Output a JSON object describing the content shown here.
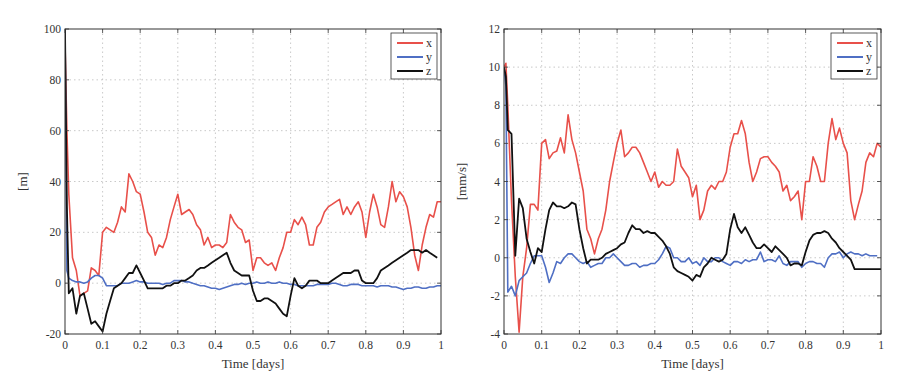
{
  "chart_data": [
    {
      "type": "line",
      "title": "",
      "xlabel": "Time [days]",
      "ylabel": "[m]",
      "xlim": [
        0,
        1
      ],
      "ylim": [
        -20,
        100
      ],
      "xticks": [
        "0",
        "0.1",
        "0.2",
        "0.3",
        "0.4",
        "0.5",
        "0.6",
        "0.7",
        "0.8",
        "0.9",
        "1"
      ],
      "yticks": [
        "-20",
        "0",
        "20",
        "40",
        "60",
        "80",
        "100"
      ],
      "grid": true,
      "legend_position": "top-right",
      "legend": [
        "x",
        "y",
        "z"
      ],
      "x": [
        0,
        0.005,
        0.01,
        0.02,
        0.03,
        0.04,
        0.05,
        0.06,
        0.07,
        0.08,
        0.09,
        0.1,
        0.11,
        0.12,
        0.13,
        0.14,
        0.15,
        0.16,
        0.17,
        0.18,
        0.19,
        0.2,
        0.21,
        0.22,
        0.23,
        0.24,
        0.25,
        0.26,
        0.27,
        0.28,
        0.29,
        0.3,
        0.31,
        0.32,
        0.33,
        0.34,
        0.35,
        0.36,
        0.37,
        0.38,
        0.39,
        0.4,
        0.41,
        0.42,
        0.43,
        0.44,
        0.45,
        0.46,
        0.47,
        0.48,
        0.49,
        0.5,
        0.51,
        0.52,
        0.53,
        0.54,
        0.55,
        0.56,
        0.57,
        0.58,
        0.59,
        0.6,
        0.61,
        0.62,
        0.63,
        0.64,
        0.65,
        0.66,
        0.67,
        0.68,
        0.69,
        0.7,
        0.71,
        0.72,
        0.73,
        0.74,
        0.75,
        0.76,
        0.77,
        0.78,
        0.79,
        0.8,
        0.81,
        0.82,
        0.83,
        0.84,
        0.85,
        0.86,
        0.87,
        0.88,
        0.89,
        0.9,
        0.91,
        0.92,
        0.93,
        0.94,
        0.95,
        0.96,
        0.97,
        0.98,
        0.99,
        1.0
      ],
      "series": [
        {
          "name": "x",
          "color": "#e8504a",
          "values": [
            95,
            60,
            35,
            10,
            5,
            -5,
            -4,
            -3,
            6,
            5,
            3,
            20,
            22,
            21,
            20,
            24,
            30,
            28,
            43,
            40,
            36,
            35,
            28,
            20,
            18,
            11,
            15,
            14,
            18,
            25,
            30,
            35,
            27,
            28,
            29,
            27,
            23,
            21,
            15,
            18,
            14,
            15,
            15,
            14,
            16,
            27,
            24,
            22,
            21,
            16,
            17,
            5,
            10,
            10,
            8,
            7,
            8,
            5,
            10,
            14,
            20,
            20,
            25,
            23,
            26,
            23,
            15,
            15,
            22,
            24,
            28,
            30,
            31,
            32,
            33,
            27,
            30,
            27,
            30,
            32,
            28,
            18,
            28,
            35,
            30,
            23,
            22,
            30,
            40,
            32,
            36,
            34,
            30,
            22,
            11,
            5,
            15,
            22,
            27,
            26,
            32,
            32
          ]
        },
        {
          "name": "y",
          "color": "#4f6fc4",
          "values": [
            100,
            5,
            2,
            1,
            0.5,
            0.5,
            0,
            0.5,
            2,
            3,
            3,
            2,
            -1,
            -1,
            -1,
            -1,
            0,
            0,
            0,
            0.5,
            1,
            0.5,
            0.5,
            0,
            0,
            0,
            0,
            -0.5,
            0,
            0,
            1,
            1,
            1,
            0.5,
            0.5,
            0,
            -0.5,
            -1,
            -1,
            -1.5,
            -2,
            -2,
            -2.5,
            -2,
            -1.5,
            -1,
            -0.5,
            -0.5,
            0,
            -0.5,
            0,
            0,
            0.5,
            0,
            0,
            0.5,
            0,
            0,
            0.5,
            0,
            0,
            -0.5,
            -0.5,
            -1,
            -1,
            -1,
            -1,
            -1,
            -0.5,
            -0.5,
            -0.5,
            -0.5,
            0,
            0,
            -0.5,
            -1,
            -1,
            -0.5,
            -0.5,
            -0.5,
            -1,
            -1,
            -1,
            -1,
            -1.5,
            -1,
            -1,
            -1,
            -1.5,
            -1.5,
            -2,
            -2.5,
            -2,
            -2,
            -1.5,
            -1.5,
            -2,
            -2,
            -1.5,
            -1.5,
            -1,
            -1
          ]
        },
        {
          "name": "z",
          "color": "#111111",
          "values": [
            100,
            30,
            -4,
            -2,
            -12,
            -5,
            -4,
            -10,
            -16,
            -15,
            -17,
            -19,
            -12,
            -7,
            -2,
            -1,
            0,
            2,
            4,
            4,
            7,
            4,
            1,
            -2,
            -2,
            -2,
            -2,
            -2,
            -1,
            -1,
            0,
            0,
            1,
            1,
            2,
            3,
            5,
            6,
            6,
            7,
            8,
            9,
            10,
            11,
            12,
            8,
            5,
            4,
            3,
            3,
            3,
            -3,
            -7,
            -7,
            -6,
            -6,
            -7,
            -8,
            -10,
            -12,
            -13,
            -5,
            2,
            -1,
            -2,
            -1,
            1,
            1,
            1,
            0,
            0,
            0,
            1,
            2,
            3,
            4,
            4,
            4,
            5,
            5,
            1,
            0,
            0,
            0,
            2,
            5,
            6,
            7,
            8,
            9,
            10,
            11,
            12,
            13,
            13,
            13,
            12,
            13,
            12,
            11,
            10
          ]
        }
      ]
    },
    {
      "type": "line",
      "title": "",
      "xlabel": "Time [days]",
      "ylabel": "[mm/s]",
      "xlim": [
        0,
        1
      ],
      "ylim": [
        -4,
        12
      ],
      "xticks": [
        "0",
        "0.1",
        "0.2",
        "0.3",
        "0.4",
        "0.5",
        "0.6",
        "0.7",
        "0.8",
        "0.9",
        "1"
      ],
      "yticks": [
        "-4",
        "-2",
        "0",
        "2",
        "4",
        "6",
        "8",
        "10",
        "12"
      ],
      "grid": true,
      "legend_position": "top-right",
      "legend": [
        "x",
        "y",
        "z"
      ],
      "x": [
        0,
        0.005,
        0.01,
        0.02,
        0.03,
        0.04,
        0.05,
        0.06,
        0.07,
        0.08,
        0.09,
        0.1,
        0.11,
        0.12,
        0.13,
        0.14,
        0.15,
        0.16,
        0.17,
        0.18,
        0.19,
        0.2,
        0.21,
        0.22,
        0.23,
        0.24,
        0.25,
        0.26,
        0.27,
        0.28,
        0.29,
        0.3,
        0.31,
        0.32,
        0.33,
        0.34,
        0.35,
        0.36,
        0.37,
        0.38,
        0.39,
        0.4,
        0.41,
        0.42,
        0.43,
        0.44,
        0.45,
        0.46,
        0.47,
        0.48,
        0.49,
        0.5,
        0.51,
        0.52,
        0.53,
        0.54,
        0.55,
        0.56,
        0.57,
        0.58,
        0.59,
        0.6,
        0.61,
        0.62,
        0.63,
        0.64,
        0.65,
        0.66,
        0.67,
        0.68,
        0.69,
        0.7,
        0.71,
        0.72,
        0.73,
        0.74,
        0.75,
        0.76,
        0.77,
        0.78,
        0.79,
        0.8,
        0.81,
        0.82,
        0.83,
        0.84,
        0.85,
        0.86,
        0.87,
        0.88,
        0.89,
        0.9,
        0.91,
        0.92,
        0.93,
        0.94,
        0.95,
        0.96,
        0.97,
        0.98,
        0.99,
        1.0
      ],
      "series": [
        {
          "name": "x",
          "color": "#e8504a",
          "values": [
            10,
            10.2,
            8,
            3,
            -1,
            -3.9,
            -1,
            0.5,
            2.8,
            2.8,
            2.5,
            6,
            6.2,
            5.2,
            5.5,
            5.6,
            6.3,
            5.5,
            7.5,
            6.2,
            5.5,
            4.5,
            3.5,
            1.5,
            1,
            0.2,
            1,
            1.5,
            2.5,
            4,
            5,
            6,
            6.7,
            5.3,
            5.5,
            5.8,
            5.8,
            5.5,
            5,
            4.5,
            4,
            4.5,
            3.7,
            4,
            3.8,
            3.8,
            4,
            5.7,
            4.8,
            4.5,
            4.2,
            3.2,
            3.8,
            2,
            2.5,
            3.5,
            3.8,
            3.6,
            4,
            4,
            4.5,
            5.8,
            6.5,
            6.5,
            7.2,
            6.5,
            5,
            4,
            4.5,
            5.2,
            5.3,
            5.3,
            5,
            4.8,
            4.5,
            3.5,
            3.8,
            3,
            3.2,
            3.5,
            2,
            4,
            4,
            5.3,
            4.8,
            4,
            4,
            6,
            7.3,
            6.2,
            6.8,
            6,
            5.5,
            3,
            2,
            2.8,
            3.5,
            5,
            5.5,
            5.3,
            6,
            5.8
          ]
        },
        {
          "name": "y",
          "color": "#4f6fc4",
          "values": [
            10,
            9,
            -1.8,
            -1.5,
            -2,
            -1.2,
            -1,
            -0.8,
            -0.3,
            0.1,
            0.1,
            0.1,
            -0.5,
            -1.3,
            -0.8,
            -0.2,
            -0.3,
            0,
            0.2,
            0.2,
            0,
            -0.2,
            -0.3,
            -0.2,
            -0.5,
            -0.4,
            -0.3,
            -0.3,
            0,
            0,
            0.2,
            0,
            -0.2,
            -0.4,
            -0.4,
            -0.3,
            -0.3,
            -0.5,
            -0.4,
            -0.4,
            -0.3,
            -0.3,
            -0.1,
            0.2,
            0.6,
            0.5,
            0,
            0,
            -0.2,
            -0.2,
            0,
            -0.3,
            -0.2,
            -0.4,
            0,
            -0.2,
            -0.2,
            0,
            0,
            -0.2,
            -0.3,
            -0.4,
            -0.2,
            -0.2,
            -0.3,
            -0.1,
            -0.2,
            -0.1,
            -0.1,
            0.3,
            -0.2,
            -0.1,
            -0.1,
            -0.2,
            0.1,
            -0.3,
            -0.4,
            -0.2,
            -0.2,
            -0.2,
            -0.5,
            -0.3,
            -0.2,
            -0.2,
            -0.3,
            -0.3,
            -0.5,
            0,
            0.2,
            0.2,
            0.3,
            0,
            0.2,
            0.3,
            0.2,
            0.2,
            0.1,
            0.2,
            0.1,
            0.1,
            0.1
          ]
        },
        {
          "name": "z",
          "color": "#111111",
          "values": [
            10,
            9.5,
            6.7,
            6.5,
            0.1,
            3.1,
            2.6,
            1,
            0.3,
            -0.3,
            0.5,
            0.3,
            1.5,
            2.5,
            2.9,
            2.7,
            2.7,
            2.6,
            2.7,
            2.9,
            2.8,
            1.5,
            0.5,
            -0.3,
            -0.1,
            -0.1,
            -0.1,
            0,
            0.2,
            0.3,
            0.4,
            0.5,
            0.7,
            0.8,
            1.3,
            1.7,
            1.5,
            1.5,
            1.3,
            1.4,
            1.3,
            1.3,
            1.1,
            0.9,
            0.6,
            0.2,
            -0.5,
            -0.7,
            -0.8,
            -0.9,
            -1,
            -1.2,
            -0.9,
            -1,
            -0.5,
            -0.3,
            0,
            -0.1,
            -0.2,
            -0.1,
            0.2,
            1.5,
            2.3,
            1.6,
            1.3,
            1.6,
            1.2,
            0.8,
            0.5,
            0.5,
            0.7,
            0.5,
            0.3,
            0.6,
            0.4,
            0.2,
            0,
            -0.4,
            -0.3,
            -0.3,
            -0.4,
            0.3,
            0.9,
            1.2,
            1.3,
            1.3,
            1.4,
            1.3,
            1,
            0.8,
            0.5,
            0.3,
            0.1,
            -0.1,
            -0.6,
            -0.6,
            -0.6,
            -0.6,
            -0.6,
            -0.6,
            -0.6,
            -0.6
          ]
        }
      ]
    }
  ]
}
